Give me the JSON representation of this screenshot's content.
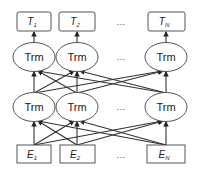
{
  "diagram": {
    "title": "",
    "colors": {
      "stroke": "#333333",
      "box_stroke": "#555555",
      "text": "#222222",
      "background": "#ffffff"
    },
    "outputs": [
      {
        "label": "T",
        "sub": "1"
      },
      {
        "label": "T",
        "sub": "2"
      },
      {
        "label": "T",
        "sub": "N"
      }
    ],
    "top_layer": [
      {
        "label": "Trm"
      },
      {
        "label": "Trm"
      },
      {
        "label": "Trm"
      }
    ],
    "bottom_layer": [
      {
        "label": "Trm"
      },
      {
        "label": "Trm"
      },
      {
        "label": "Trm"
      }
    ],
    "inputs": [
      {
        "label": "E",
        "sub": "1"
      },
      {
        "label": "E",
        "sub": "2"
      },
      {
        "label": "E",
        "sub": "N"
      }
    ],
    "ellipsis": "…"
  }
}
